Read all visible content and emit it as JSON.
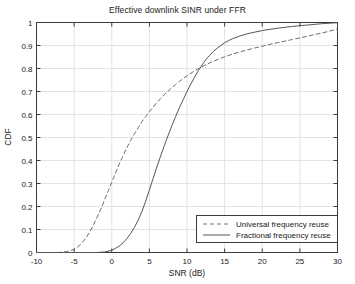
{
  "chart_data": {
    "type": "line",
    "title": "Effective downlink SINR under FFR",
    "xlabel": "SNR (dB)",
    "ylabel": "CDF",
    "xlim": [
      -10,
      30
    ],
    "ylim": [
      0,
      1
    ],
    "xticks": [
      -10,
      -5,
      0,
      5,
      10,
      15,
      20,
      25,
      30
    ],
    "xtick_labels": [
      "-10",
      "-5",
      "0",
      "5",
      "10",
      "15",
      "20",
      "25",
      "30"
    ],
    "yticks": [
      0,
      0.1,
      0.2,
      0.3,
      0.4,
      0.5,
      0.6,
      0.7,
      0.8,
      0.9,
      1
    ],
    "ytick_labels": [
      "0",
      "0.1",
      "0.2",
      "0.3",
      "0.4",
      "0.5",
      "0.6",
      "0.7",
      "0.8",
      "0.9",
      "1"
    ],
    "grid": true,
    "legend_position": "lower right",
    "series": [
      {
        "name": "Universal frequency reuse",
        "style": "dashed",
        "color": "#6e6e6e",
        "points": [
          [
            -10,
            0.0
          ],
          [
            -7,
            0.0
          ],
          [
            -6,
            0.004
          ],
          [
            -5.5,
            0.008
          ],
          [
            -5,
            0.015
          ],
          [
            -4.5,
            0.025
          ],
          [
            -4,
            0.04
          ],
          [
            -3.5,
            0.06
          ],
          [
            -3,
            0.085
          ],
          [
            -2.5,
            0.115
          ],
          [
            -2,
            0.15
          ],
          [
            -1.5,
            0.185
          ],
          [
            -1,
            0.225
          ],
          [
            -0.5,
            0.265
          ],
          [
            0,
            0.305
          ],
          [
            0.5,
            0.345
          ],
          [
            1,
            0.385
          ],
          [
            1.5,
            0.42
          ],
          [
            2,
            0.455
          ],
          [
            2.5,
            0.487
          ],
          [
            3,
            0.515
          ],
          [
            3.5,
            0.542
          ],
          [
            4,
            0.568
          ],
          [
            4.5,
            0.59
          ],
          [
            5,
            0.612
          ],
          [
            5.5,
            0.632
          ],
          [
            6,
            0.652
          ],
          [
            6.5,
            0.67
          ],
          [
            7,
            0.687
          ],
          [
            7.5,
            0.702
          ],
          [
            8,
            0.717
          ],
          [
            8.5,
            0.731
          ],
          [
            9,
            0.744
          ],
          [
            9.5,
            0.757
          ],
          [
            10,
            0.768
          ],
          [
            11,
            0.79
          ],
          [
            12,
            0.808
          ],
          [
            13,
            0.824
          ],
          [
            14,
            0.838
          ],
          [
            15,
            0.851
          ],
          [
            16,
            0.862
          ],
          [
            17,
            0.872
          ],
          [
            18,
            0.881
          ],
          [
            19,
            0.889
          ],
          [
            20,
            0.897
          ],
          [
            21,
            0.905
          ],
          [
            22,
            0.912
          ],
          [
            23,
            0.919
          ],
          [
            24,
            0.926
          ],
          [
            25,
            0.933
          ],
          [
            26,
            0.94
          ],
          [
            27,
            0.948
          ],
          [
            28,
            0.955
          ],
          [
            29,
            0.963
          ],
          [
            30,
            0.972
          ]
        ]
      },
      {
        "name": "Fractional frequency reuse",
        "style": "solid",
        "color": "#555555",
        "points": [
          [
            -10,
            0.0
          ],
          [
            -2,
            0.0
          ],
          [
            -1,
            0.002
          ],
          [
            -0.5,
            0.005
          ],
          [
            0,
            0.01
          ],
          [
            0.5,
            0.018
          ],
          [
            1,
            0.028
          ],
          [
            1.5,
            0.042
          ],
          [
            2,
            0.06
          ],
          [
            2.5,
            0.082
          ],
          [
            3,
            0.108
          ],
          [
            3.5,
            0.14
          ],
          [
            4,
            0.178
          ],
          [
            4.5,
            0.222
          ],
          [
            5,
            0.272
          ],
          [
            5.5,
            0.322
          ],
          [
            6,
            0.372
          ],
          [
            6.5,
            0.42
          ],
          [
            7,
            0.466
          ],
          [
            7.5,
            0.51
          ],
          [
            8,
            0.552
          ],
          [
            8.5,
            0.592
          ],
          [
            9,
            0.63
          ],
          [
            9.5,
            0.665
          ],
          [
            10,
            0.7
          ],
          [
            10.5,
            0.732
          ],
          [
            11,
            0.762
          ],
          [
            11.5,
            0.79
          ],
          [
            12,
            0.815
          ],
          [
            12.5,
            0.838
          ],
          [
            13,
            0.857
          ],
          [
            13.5,
            0.874
          ],
          [
            14,
            0.888
          ],
          [
            14.5,
            0.9
          ],
          [
            15,
            0.912
          ],
          [
            15.5,
            0.921
          ],
          [
            16,
            0.929
          ],
          [
            17,
            0.941
          ],
          [
            18,
            0.951
          ],
          [
            19,
            0.958
          ],
          [
            20,
            0.965
          ],
          [
            21,
            0.97
          ],
          [
            22,
            0.975
          ],
          [
            23,
            0.979
          ],
          [
            24,
            0.983
          ],
          [
            25,
            0.986
          ],
          [
            26,
            0.989
          ],
          [
            27,
            0.992
          ],
          [
            28,
            0.995
          ],
          [
            29,
            0.997
          ],
          [
            30,
            0.999
          ]
        ]
      }
    ]
  },
  "legend": {
    "entries": [
      {
        "label": "Universal frequency reuse",
        "style": "dashed"
      },
      {
        "label": "Fractional frequency reuse",
        "style": "solid"
      }
    ]
  },
  "colors": {
    "background": "#ffffff",
    "axis": "#3c3c3c",
    "grid": "#e3e3e3",
    "text": "#1a1a1a",
    "series_dashed": "#6e6e6e",
    "series_solid": "#555555"
  }
}
